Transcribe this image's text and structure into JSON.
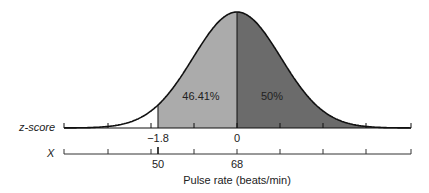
{
  "chart_data": {
    "type": "area",
    "title": "",
    "xlabel": "Pulse rate (beats/min)",
    "axes": {
      "z_axis_label": "z-score",
      "x_axis_label": "X",
      "z_ticks_labeled": [
        {
          "value": "−1.8",
          "x": 158
        },
        {
          "value": "0",
          "x": 237
        }
      ],
      "x_ticks_labeled": [
        {
          "value": "50",
          "x": 158
        },
        {
          "value": "68",
          "x": 237
        }
      ]
    },
    "distribution": {
      "mean_X": 68,
      "z_cut": -1.8,
      "X_cut": 50
    },
    "regions": [
      {
        "name": "left-shaded",
        "from_z": -1.8,
        "to_z": 0,
        "label": "46.41%",
        "color": "#a9a9a9"
      },
      {
        "name": "right-shaded",
        "from_z": 0,
        "to_z": "inf",
        "label": "50%",
        "color": "#6b6b6b"
      }
    ],
    "grid": false
  },
  "labels": {
    "z_axis": "z-score",
    "x_axis": "X",
    "z_cut": "−1.8",
    "z_mean": "0",
    "x_cut": "50",
    "x_mean": "68",
    "left_pct": "46.41%",
    "right_pct": "50%",
    "xlabel": "Pulse rate (beats/min)"
  }
}
